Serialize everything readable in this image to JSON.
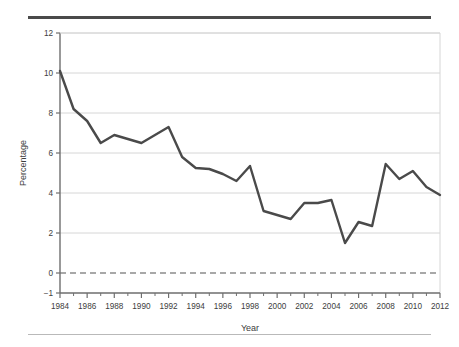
{
  "figure": {
    "background_color": "#ffffff",
    "top_rule_color": "#4a4a4a",
    "bottom_rule_color": "#b9b9b9"
  },
  "chart_data": {
    "type": "line",
    "title": "",
    "subtitle": "",
    "xlabel": "Year",
    "ylabel": "Percentage",
    "xlim": [
      1984,
      2012
    ],
    "ylim": [
      -1,
      12
    ],
    "grid": true,
    "grid_axis": "y",
    "legend": false,
    "legend_position": "none",
    "line_color": "#4a4a4a",
    "line_width": 2.4,
    "zero_line": {
      "value": 0,
      "style": "dashed",
      "color": "#8c8c8c"
    },
    "y_ticks": [
      -1,
      0,
      2,
      4,
      6,
      8,
      10,
      12
    ],
    "y_tick_labels": [
      "−1",
      "0",
      "2",
      "4",
      "6",
      "8",
      "10",
      "12"
    ],
    "x_ticks": [
      1984,
      1986,
      1988,
      1990,
      1992,
      1994,
      1996,
      1998,
      2000,
      2002,
      2004,
      2006,
      2008,
      2010,
      2012
    ],
    "x_tick_labels": [
      "1984",
      "1986",
      "1988",
      "1990",
      "1992",
      "1994",
      "1996",
      "1998",
      "2000",
      "2002",
      "2004",
      "2006",
      "2008",
      "2010",
      "2012"
    ],
    "x_minor_ticks": [
      1985,
      1987,
      1989,
      1991,
      1993,
      1995,
      1997,
      1999,
      2001,
      2003,
      2005,
      2007,
      2009,
      2011
    ],
    "x": [
      1984,
      1985,
      1986,
      1987,
      1988,
      1989,
      1990,
      1991,
      1992,
      1993,
      1994,
      1995,
      1996,
      1997,
      1998,
      1999,
      2000,
      2001,
      2002,
      2003,
      2004,
      2005,
      2006,
      2007,
      2008,
      2009,
      2010,
      2011,
      2012
    ],
    "values": [
      10.1,
      8.2,
      7.6,
      6.5,
      6.9,
      6.7,
      6.5,
      6.9,
      7.3,
      5.8,
      5.25,
      5.2,
      4.95,
      4.6,
      5.35,
      3.1,
      2.9,
      2.7,
      3.5,
      3.5,
      3.65,
      1.5,
      2.55,
      2.35,
      5.45,
      4.7,
      5.1,
      4.3,
      3.9
    ],
    "series": [
      {
        "name": "Percentage",
        "values": [
          10.1,
          8.2,
          7.6,
          6.5,
          6.9,
          6.7,
          6.5,
          6.9,
          7.3,
          5.8,
          5.25,
          5.2,
          4.95,
          4.6,
          5.35,
          3.1,
          2.9,
          2.7,
          3.5,
          3.5,
          3.65,
          1.5,
          2.55,
          2.35,
          5.45,
          4.7,
          5.1,
          4.3,
          3.9
        ]
      }
    ]
  }
}
